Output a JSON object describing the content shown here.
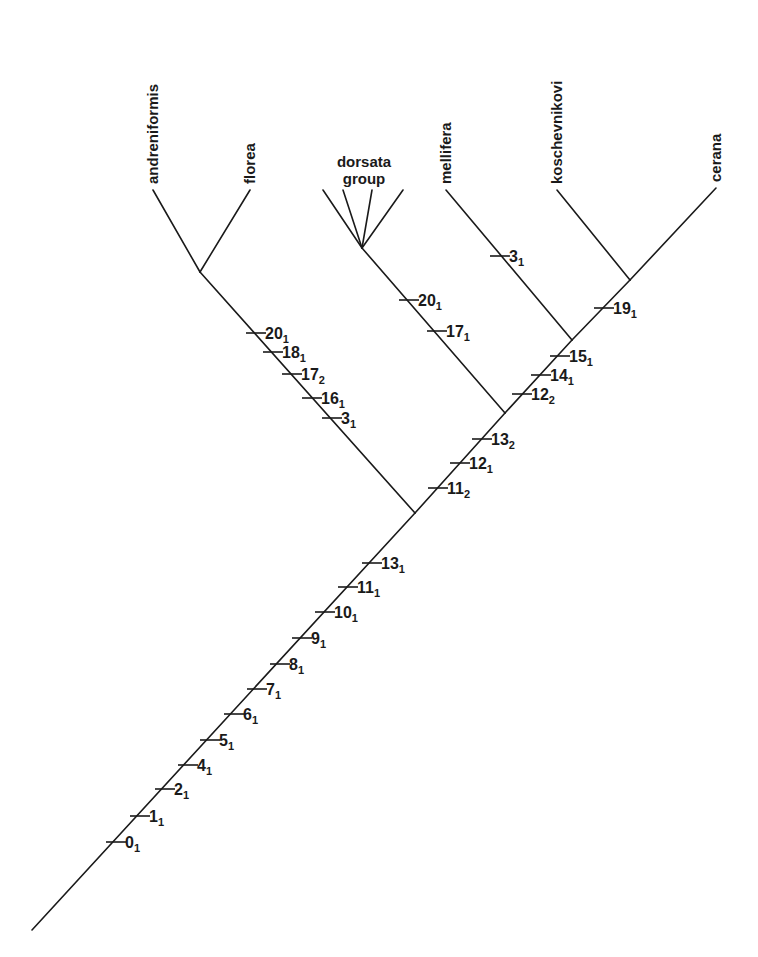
{
  "taxa": [
    {
      "id": "andreniformis",
      "label": "andreniformis",
      "tip": [
        153,
        190
      ],
      "rotate": true
    },
    {
      "id": "florea",
      "label": "florea",
      "tip": [
        250,
        190
      ],
      "rotate": true
    },
    {
      "id": "dorsata",
      "label_line1": "dorsata",
      "label_line2": "group",
      "rotate": false
    },
    {
      "id": "mellifera",
      "label": "mellifera",
      "tip": [
        446,
        190
      ],
      "rotate": true
    },
    {
      "id": "koschevnikovi",
      "label": "koschevnikovi",
      "tip": [
        557,
        190
      ],
      "rotate": true
    },
    {
      "id": "cerana",
      "label": "cerana",
      "tip": [
        716,
        188
      ],
      "rotate": true
    }
  ],
  "nodes": {
    "root": [
      32,
      930
    ],
    "micrapis": [
      415,
      513
    ],
    "af": [
      200,
      272
    ],
    "dorsata_mc": [
      505,
      413
    ],
    "dorsata": [
      362,
      248
    ],
    "mc": [
      572,
      340
    ],
    "kc": [
      630,
      280
    ]
  },
  "dorsata_tips": [
    [
      323,
      190
    ],
    [
      343,
      190
    ],
    [
      372,
      190
    ],
    [
      403,
      190
    ]
  ],
  "characters": {
    "trunk": [
      {
        "num": "0",
        "state": "1",
        "x": 116,
        "y": 842
      },
      {
        "num": "1",
        "state": "1",
        "x": 140,
        "y": 816
      },
      {
        "num": "2",
        "state": "1",
        "x": 165,
        "y": 789
      },
      {
        "num": "4",
        "state": "1",
        "x": 188,
        "y": 765
      },
      {
        "num": "5",
        "state": "1",
        "x": 210,
        "y": 740
      },
      {
        "num": "6",
        "state": "1",
        "x": 234,
        "y": 714
      },
      {
        "num": "7",
        "state": "1",
        "x": 257,
        "y": 689
      },
      {
        "num": "8",
        "state": "1",
        "x": 280,
        "y": 664
      },
      {
        "num": "9",
        "state": "1",
        "x": 302,
        "y": 638
      },
      {
        "num": "10",
        "state": "1",
        "x": 325,
        "y": 612
      },
      {
        "num": "11",
        "state": "1",
        "x": 348,
        "y": 587
      },
      {
        "num": "13",
        "state": "1",
        "x": 372,
        "y": 563
      }
    ],
    "dwarf_stem": [
      {
        "num": "20",
        "state": "1",
        "x": 256,
        "y": 333
      },
      {
        "num": "18",
        "state": "1",
        "x": 273,
        "y": 352
      },
      {
        "num": "17",
        "state": "2",
        "x": 292,
        "y": 374
      },
      {
        "num": "16",
        "state": "1",
        "x": 312,
        "y": 398
      },
      {
        "num": "3",
        "state": "1",
        "x": 332,
        "y": 418
      }
    ],
    "upper_trunk": [
      {
        "num": "11",
        "state": "2",
        "x": 438,
        "y": 488
      },
      {
        "num": "12",
        "state": "1",
        "x": 460,
        "y": 463
      },
      {
        "num": "13",
        "state": "2",
        "x": 482,
        "y": 439
      }
    ],
    "dorsata_stem": [
      {
        "num": "20",
        "state": "1",
        "x": 409,
        "y": 300
      },
      {
        "num": "17",
        "state": "1",
        "x": 437,
        "y": 331
      }
    ],
    "cavity_stem": [
      {
        "num": "12",
        "state": "2",
        "x": 522,
        "y": 394
      },
      {
        "num": "14",
        "state": "1",
        "x": 541,
        "y": 375
      },
      {
        "num": "15",
        "state": "1",
        "x": 560,
        "y": 356
      }
    ],
    "mellifera_branch": [
      {
        "num": "3",
        "state": "1",
        "x": 500,
        "y": 256
      }
    ],
    "kc_stem": [
      {
        "num": "19",
        "state": "1",
        "x": 604,
        "y": 308
      }
    ]
  }
}
